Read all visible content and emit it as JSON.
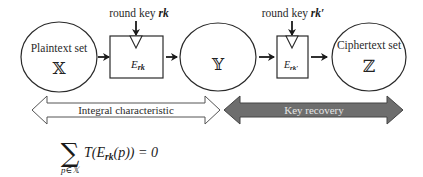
{
  "diagram": {
    "nodes": {
      "plaintext": {
        "label": "Plaintext set",
        "symbol": "𝕏"
      },
      "intermediate": {
        "label": "",
        "symbol": "𝕐"
      },
      "ciphertext": {
        "label": "Ciphertext set",
        "symbol": "ℤ"
      }
    },
    "boxes": {
      "first": {
        "key_label": "round key ",
        "key_symbol": "rk",
        "func": "E",
        "sub": "rk"
      },
      "second": {
        "key_label": "round key ",
        "key_symbol": "rk′",
        "func": "E",
        "sub": "rk′"
      }
    },
    "phases": {
      "integral": {
        "label": "Integral characteristic",
        "fill": "#ffffff"
      },
      "recovery": {
        "label": "Key recovery",
        "fill": "#6e6e6e"
      }
    },
    "formula": {
      "sum": "∑",
      "sum_sub": "p∈𝕏",
      "body_T": "T(",
      "body_E": "E",
      "body_sub": "rk",
      "body_rest": "(p)) = 0"
    }
  }
}
